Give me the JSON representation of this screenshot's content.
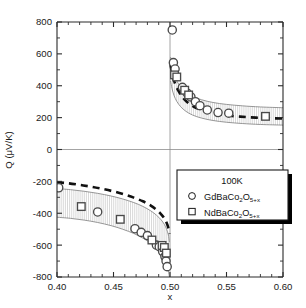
{
  "figure": {
    "background": "#ffffff",
    "frame_color": "#2b2b2b"
  },
  "chart_data": {
    "type": "scatter",
    "title": "",
    "xlabel": "x",
    "ylabel": "Q (μV/K)",
    "xlim": [
      0.4,
      0.6
    ],
    "ylim": [
      -800,
      800
    ],
    "xticks": [
      0.4,
      0.45,
      0.5,
      0.55,
      0.6
    ],
    "xticklabels": [
      "0.40",
      "0.45",
      "0.50",
      "0.55",
      "0.60"
    ],
    "yticks": [
      -800,
      -600,
      -400,
      -200,
      0,
      200,
      400,
      600,
      800
    ],
    "yticklabels": [
      "-800",
      "-600",
      "-400",
      "-200",
      "0",
      "200",
      "400",
      "600",
      "800"
    ],
    "x_minor_count": 4,
    "y_minor_count": 1,
    "grid": false,
    "legend_position": "lower-right",
    "annotations": [
      {
        "name": "zero-reference-line",
        "type": "hline",
        "y": 0,
        "color": "#8d8d8d"
      },
      {
        "name": "x-half-reference-line",
        "type": "vline",
        "x": 0.5,
        "color": "#8d8d8d"
      }
    ],
    "series": [
      {
        "name": "GdBaCo2O5+x",
        "label": "GdBaCo₂O₅₊ₓ",
        "marker": "circle",
        "color": "#4a4a4a",
        "points": [
          [
            0.4015,
            -240
          ],
          [
            0.436,
            -392
          ],
          [
            0.469,
            -497
          ],
          [
            0.4745,
            -520
          ],
          [
            0.48,
            -540
          ],
          [
            0.488,
            -600
          ],
          [
            0.4905,
            -610
          ],
          [
            0.4935,
            -640
          ],
          [
            0.4955,
            -672
          ],
          [
            0.4965,
            -700
          ],
          [
            0.4975,
            -735
          ],
          [
            0.502,
            750
          ],
          [
            0.503,
            545
          ],
          [
            0.5045,
            505
          ],
          [
            0.511,
            390
          ],
          [
            0.515,
            355
          ],
          [
            0.5185,
            330
          ],
          [
            0.5225,
            300
          ],
          [
            0.5265,
            275
          ],
          [
            0.533,
            248
          ],
          [
            0.5425,
            232
          ],
          [
            0.552,
            228
          ]
        ]
      },
      {
        "name": "NdBaCo2O5+x",
        "label": "NdBaCo₂O₅₊ₓ",
        "marker": "square",
        "color": "#4a4a4a",
        "points": [
          [
            0.4215,
            -358
          ],
          [
            0.456,
            -438
          ],
          [
            0.484,
            -568
          ],
          [
            0.493,
            -602
          ],
          [
            0.495,
            -615
          ],
          [
            0.4968,
            -650
          ],
          [
            0.504,
            468
          ],
          [
            0.506,
            455
          ],
          [
            0.513,
            372
          ],
          [
            0.5165,
            342
          ],
          [
            0.5845,
            208
          ]
        ]
      }
    ],
    "curves": [
      {
        "name": "model-dashed-curve-negative-branch",
        "style": "dashed",
        "color": "#111111",
        "points": [
          [
            0.4,
            -205
          ],
          [
            0.41,
            -212
          ],
          [
            0.42,
            -222
          ],
          [
            0.43,
            -233
          ],
          [
            0.44,
            -247
          ],
          [
            0.45,
            -263
          ],
          [
            0.46,
            -283
          ],
          [
            0.468,
            -302
          ],
          [
            0.476,
            -325
          ],
          [
            0.483,
            -352
          ],
          [
            0.488,
            -378
          ],
          [
            0.492,
            -405
          ],
          [
            0.495,
            -432
          ],
          [
            0.497,
            -460
          ],
          [
            0.4985,
            -492
          ],
          [
            0.4995,
            -530
          ]
        ]
      },
      {
        "name": "model-dashed-curve-positive-branch",
        "style": "dashed",
        "color": "#111111",
        "points": [
          [
            0.5005,
            530
          ],
          [
            0.5015,
            492
          ],
          [
            0.503,
            445
          ],
          [
            0.505,
            405
          ],
          [
            0.5075,
            368
          ],
          [
            0.5105,
            335
          ],
          [
            0.514,
            305
          ],
          [
            0.5185,
            280
          ],
          [
            0.524,
            258
          ],
          [
            0.531,
            240
          ],
          [
            0.54,
            225
          ],
          [
            0.55,
            214
          ],
          [
            0.562,
            206
          ],
          [
            0.576,
            200
          ],
          [
            0.59,
            196
          ],
          [
            0.6,
            194
          ]
        ]
      }
    ],
    "bands": [
      {
        "name": "uncertainty-band-negative-branch",
        "hatched": true,
        "upper": [
          [
            0.4,
            -245
          ],
          [
            0.412,
            -252
          ],
          [
            0.424,
            -262
          ],
          [
            0.436,
            -275
          ],
          [
            0.448,
            -292
          ],
          [
            0.458,
            -310
          ],
          [
            0.468,
            -333
          ],
          [
            0.476,
            -357
          ],
          [
            0.483,
            -385
          ],
          [
            0.488,
            -412
          ],
          [
            0.492,
            -440
          ],
          [
            0.495,
            -470
          ],
          [
            0.497,
            -500
          ],
          [
            0.4985,
            -535
          ],
          [
            0.4995,
            -580
          ]
        ],
        "lower": [
          [
            0.4,
            -425
          ],
          [
            0.412,
            -432
          ],
          [
            0.424,
            -443
          ],
          [
            0.436,
            -458
          ],
          [
            0.448,
            -478
          ],
          [
            0.458,
            -500
          ],
          [
            0.468,
            -527
          ],
          [
            0.476,
            -556
          ],
          [
            0.483,
            -588
          ],
          [
            0.488,
            -620
          ],
          [
            0.492,
            -653
          ],
          [
            0.495,
            -688
          ],
          [
            0.497,
            -722
          ],
          [
            0.4985,
            -760
          ],
          [
            0.4995,
            -800
          ]
        ]
      },
      {
        "name": "uncertainty-band-positive-branch",
        "hatched": true,
        "upper": [
          [
            0.5005,
            580
          ],
          [
            0.5018,
            520
          ],
          [
            0.5035,
            472
          ],
          [
            0.506,
            430
          ],
          [
            0.5095,
            392
          ],
          [
            0.514,
            360
          ],
          [
            0.52,
            333
          ],
          [
            0.528,
            312
          ],
          [
            0.538,
            295
          ],
          [
            0.55,
            283
          ],
          [
            0.564,
            274
          ],
          [
            0.58,
            267
          ],
          [
            0.6,
            262
          ]
        ],
        "lower": [
          [
            0.5005,
            430
          ],
          [
            0.5018,
            382
          ],
          [
            0.5035,
            340
          ],
          [
            0.506,
            302
          ],
          [
            0.5095,
            268
          ],
          [
            0.514,
            240
          ],
          [
            0.52,
            216
          ],
          [
            0.528,
            197
          ],
          [
            0.538,
            182
          ],
          [
            0.55,
            171
          ],
          [
            0.564,
            163
          ],
          [
            0.58,
            157
          ],
          [
            0.6,
            153
          ]
        ]
      }
    ],
    "legend": {
      "temperature": "100K",
      "entries": [
        {
          "marker": "circle",
          "label_main": "GdBaCo",
          "sub1": "2",
          "label_mid": "O",
          "sub2": "5+x"
        },
        {
          "marker": "square",
          "label_main": "NdBaCo",
          "sub1": "2",
          "label_mid": "O",
          "sub2": "5+x"
        }
      ]
    }
  }
}
